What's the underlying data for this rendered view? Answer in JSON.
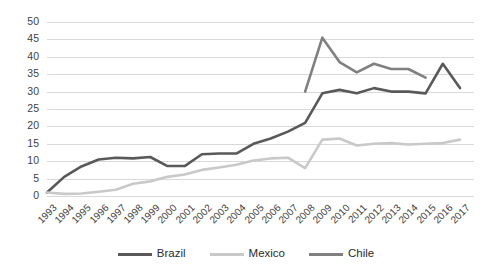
{
  "chart_data": {
    "type": "line",
    "title": "",
    "subtitle": "",
    "xlabel": "",
    "ylabel": "",
    "ylim": [
      0,
      50
    ],
    "ytick_step": 5,
    "yticks": [
      "0",
      "5",
      "10",
      "15",
      "20",
      "25",
      "30",
      "35",
      "40",
      "45",
      "50"
    ],
    "grid": "horizontal",
    "legend_position": "bottom-center",
    "x": [
      1993,
      1994,
      1995,
      1996,
      1997,
      1998,
      1999,
      2000,
      2001,
      2002,
      2003,
      2004,
      2005,
      2006,
      2007,
      2008,
      2009,
      2010,
      2011,
      2012,
      2013,
      2014,
      2015,
      2016,
      2017
    ],
    "categories": [
      "1993",
      "1994",
      "1995",
      "1996",
      "1997",
      "1998",
      "1999",
      "2000",
      "2001",
      "2002",
      "2003",
      "2004",
      "2005",
      "2006",
      "2007",
      "2008",
      "2009",
      "2010",
      "2011",
      "2012",
      "2013",
      "2014",
      "2015",
      "2016",
      "2017"
    ],
    "series": [
      {
        "name": "Brazil",
        "color": "#595959",
        "values": [
          1,
          5.5,
          8.5,
          10.5,
          11,
          10.8,
          11.2,
          8.6,
          8.6,
          12,
          12.2,
          12.2,
          15,
          16.5,
          18.5,
          21,
          29.5,
          30.5,
          29.5,
          31,
          30,
          30,
          29.5,
          38,
          31
        ]
      },
      {
        "name": "Mexico",
        "color": "#c9c9c9",
        "values": [
          1,
          0.6,
          0.7,
          1.2,
          1.8,
          3.5,
          4.2,
          5.5,
          6.2,
          7.5,
          8.2,
          9,
          10.2,
          10.8,
          11,
          8,
          16.2,
          16.5,
          14.5,
          15,
          15.2,
          14.8,
          15,
          15.2,
          16.2
        ]
      },
      {
        "name": "Chile",
        "color": "#808080",
        "values": [
          null,
          null,
          null,
          null,
          null,
          null,
          null,
          null,
          null,
          null,
          null,
          null,
          null,
          null,
          null,
          30,
          45.5,
          38.5,
          35.5,
          38,
          36.5,
          36.5,
          34,
          null,
          null
        ]
      }
    ]
  },
  "legend": {
    "items": [
      {
        "label": "Brazil"
      },
      {
        "label": "Mexico"
      },
      {
        "label": "Chile"
      }
    ]
  }
}
